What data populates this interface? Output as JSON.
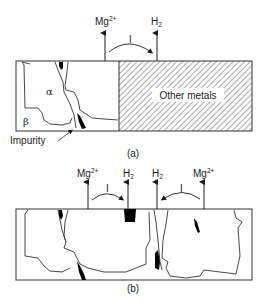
{
  "figure_a": {
    "caption": "(a)",
    "labels": {
      "mg_ion": "Mg",
      "mg_charge": "2+",
      "h2": "H",
      "h2_sub": "2",
      "current": "I",
      "alpha": "α",
      "beta": "β",
      "impurity": "Impurity",
      "other_metals": "Other metals"
    }
  },
  "figure_b": {
    "caption": "(b)",
    "labels": {
      "mg_ion_left": "Mg",
      "mg_charge_left": "2+",
      "h2_left": "H",
      "h2_sub_left": "2",
      "current_left": "I",
      "h2_right": "H",
      "h2_sub_right": "2",
      "mg_ion_right": "Mg",
      "mg_charge_right": "2+",
      "current_right": "I"
    }
  },
  "colors": {
    "stroke": "#333333",
    "impurity_fill": "#000000",
    "hatch": "#555555"
  }
}
